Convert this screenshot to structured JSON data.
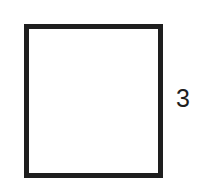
{
  "diagram": {
    "shape": "square",
    "stroke_color": "#1e1e1e",
    "fill_color": "#ffffff",
    "side_label": "3"
  }
}
